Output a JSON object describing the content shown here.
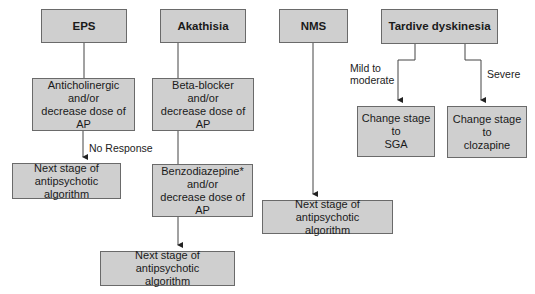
{
  "diagram": {
    "columns": {
      "eps": {
        "title": "EPS",
        "step1": "Anticholinergic\nand/or\ndecrease dose of AP",
        "edge_label": "No Response",
        "outcome": "Next stage of\nantipsychotic algorithm"
      },
      "akathisia": {
        "title": "Akathisia",
        "step1": "Beta-blocker\nand/or\ndecrease dose of AP",
        "step2": "Benzodiazepine*\nand/or\ndecrease dose of AP",
        "outcome": "Next stage of antipsychotic\nalgorithm"
      },
      "nms": {
        "title": "NMS",
        "outcome": "Next stage of antipsychotic\nalgorithm"
      },
      "tardive": {
        "title": "Tardive dyskinesia",
        "branch_left_label": "Mild to\nmoderate",
        "branch_left_outcome": "Change stage to\nSGA",
        "branch_right_label": "Severe",
        "branch_right_outcome": "Change stage to\nclozapine"
      }
    },
    "colors": {
      "box_fill": "#cfcfcf",
      "box_border": "#6a6a6a",
      "line": "#333333"
    }
  }
}
